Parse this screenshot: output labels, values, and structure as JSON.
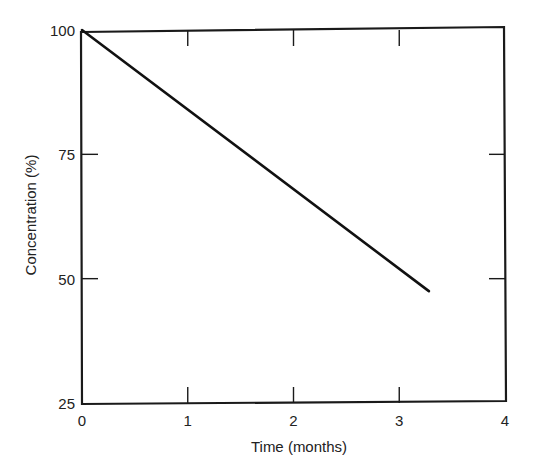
{
  "chart_data": {
    "type": "line",
    "title": "",
    "xlabel": "Time (months)",
    "ylabel": "Concentration (%)",
    "xlim": [
      0,
      4
    ],
    "ylim": [
      25,
      100
    ],
    "xticks": [
      0,
      1,
      2,
      3,
      4
    ],
    "yticks": [
      25,
      50,
      75,
      100
    ],
    "xtick_labels": [
      "0",
      "1",
      "2",
      "3",
      "4"
    ],
    "ytick_labels": [
      "25",
      "50",
      "75",
      "100"
    ],
    "grid": false,
    "legend": null,
    "series": [
      {
        "name": "Concentration",
        "x": [
          0,
          3.28
        ],
        "y": [
          100,
          47.5
        ]
      }
    ]
  }
}
